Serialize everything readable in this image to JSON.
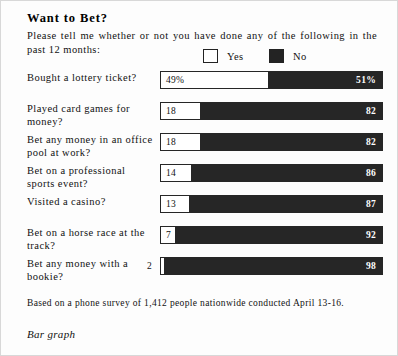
{
  "header": {
    "title": "Want to Bet?",
    "question": "Please tell me whether or not you have done any of the following in the past 12 months:"
  },
  "legend": {
    "yes_label": "Yes",
    "no_label": "No",
    "yes_color": "#ffffff",
    "no_color": "#262626"
  },
  "footer": {
    "source": "Based on a phone survey of 1,412 people nationwide conducted April 13-16.",
    "caption": "Bar graph"
  },
  "chart_data": {
    "type": "bar",
    "title": "Want to Bet?",
    "subtitle": "Please tell me whether or not you have done any of the following in the past 12 months:",
    "orientation": "horizontal",
    "stacked": true,
    "xlabel": "",
    "ylabel": "",
    "xlim": [
      0,
      100
    ],
    "grid": false,
    "legend_position": "top-right",
    "categories": [
      "Bought a lottery ticket?",
      "Played card games for money?",
      "Bet any money in an office pool at work?",
      "Bet on a professional sports event?",
      "Visited a casino?",
      "Bet on a horse race at the track?",
      "Bet any money with a bookie?"
    ],
    "series": [
      {
        "name": "Yes",
        "color": "#ffffff",
        "values": [
          49,
          18,
          18,
          14,
          13,
          7,
          2
        ]
      },
      {
        "name": "No",
        "color": "#262626",
        "values": [
          51,
          82,
          82,
          86,
          87,
          92,
          98
        ]
      }
    ],
    "rows": [
      {
        "label": "Bought a lottery ticket?",
        "yes": 49,
        "no": 51,
        "yes_text": "49%",
        "no_text": "51%",
        "yes_label_outside": false
      },
      {
        "label": "Played card games for money?",
        "yes": 18,
        "no": 82,
        "yes_text": "18",
        "no_text": "82",
        "yes_label_outside": false
      },
      {
        "label": "Bet any money in an office pool at work?",
        "yes": 18,
        "no": 82,
        "yes_text": "18",
        "no_text": "82",
        "yes_label_outside": false
      },
      {
        "label": "Bet on a professional sports event?",
        "yes": 14,
        "no": 86,
        "yes_text": "14",
        "no_text": "86",
        "yes_label_outside": false
      },
      {
        "label": "Visited a casino?",
        "yes": 13,
        "no": 87,
        "yes_text": "13",
        "no_text": "87",
        "yes_label_outside": false
      },
      {
        "label": "Bet on a horse race at the track?",
        "yes": 7,
        "no": 92,
        "yes_text": "7",
        "no_text": "92",
        "yes_label_outside": false
      },
      {
        "label": "Bet any money with a bookie?",
        "yes": 2,
        "no": 98,
        "yes_text": "2",
        "no_text": "98",
        "yes_label_outside": true
      }
    ],
    "annotation": "Based on a phone survey of 1,412 people nationwide conducted April 13-16."
  }
}
